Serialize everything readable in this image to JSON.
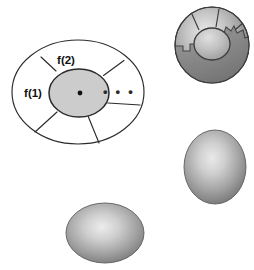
{
  "figure": {
    "background_color": "#ffffff",
    "width": 254,
    "height": 270,
    "caption": "",
    "stroke_color": "#2b2b2b",
    "inner_disc_fill": "#cccccc",
    "sphere_light": "#e8e8e8",
    "sphere_mid": "#a6a6a6",
    "sphere_dark": "#6f6f6f",
    "shadow_fill": "#8a8a8a"
  },
  "schematic": {
    "name": "sectored-disc-schematic",
    "outer_boundary_label": "",
    "center_point_label": "",
    "labels": [
      {
        "id": "f1",
        "text": "f(1)",
        "x": 33,
        "y": 93
      },
      {
        "id": "f2",
        "text": "f(2)",
        "x": 64,
        "y": 61
      },
      {
        "id": "ellipsis",
        "text": "• • •",
        "x": 112,
        "y": 93
      }
    ],
    "sector_count": 5,
    "center_dot_radius": 2.4
  },
  "solids": [
    {
      "id": "cracked-sphere",
      "name": "cracked-sectored-sphere",
      "cx": 212,
      "cy": 45,
      "rx": 37,
      "ry": 38,
      "orientation": "round",
      "has_sectors": true,
      "has_jagged_shadow": true
    },
    {
      "id": "vertical-ellipsoid",
      "name": "vertical-ellipsoid",
      "cx": 215,
      "cy": 167,
      "rx": 31,
      "ry": 37,
      "orientation": "vertical",
      "has_sectors": false,
      "has_jagged_shadow": false
    },
    {
      "id": "horizontal-ellipsoid",
      "name": "horizontal-ellipsoid",
      "cx": 105,
      "cy": 233,
      "rx": 39,
      "ry": 30,
      "orientation": "horizontal",
      "has_sectors": false,
      "has_jagged_shadow": false
    }
  ]
}
